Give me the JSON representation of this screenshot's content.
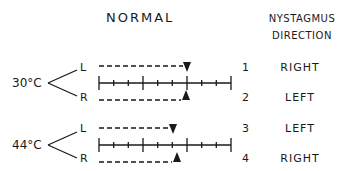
{
  "headers": {
    "normal": "NORMAL",
    "nystagmus_line1": "NYSTAGMUS",
    "nystagmus_line2": "DIRECTION"
  },
  "scale": {
    "x_start": 99,
    "x_end": 231,
    "tick_count": 10,
    "major_ticks_at": [
      0,
      3,
      6,
      9
    ]
  },
  "groups": [
    {
      "temperature": "30°C",
      "rows": [
        {
          "ear": "L",
          "number": "1",
          "direction": "RIGHT",
          "marker": "down-triangle",
          "marker_x": 187
        },
        {
          "ear": "R",
          "number": "2",
          "direction": "LEFT",
          "marker": "up-triangle",
          "marker_x": 186
        }
      ]
    },
    {
      "temperature": "44°C",
      "rows": [
        {
          "ear": "L",
          "number": "3",
          "direction": "LEFT",
          "marker": "down-triangle",
          "marker_x": 173
        },
        {
          "ear": "R",
          "number": "4",
          "direction": "RIGHT",
          "marker": "up-triangle",
          "marker_x": 177
        }
      ]
    }
  ]
}
